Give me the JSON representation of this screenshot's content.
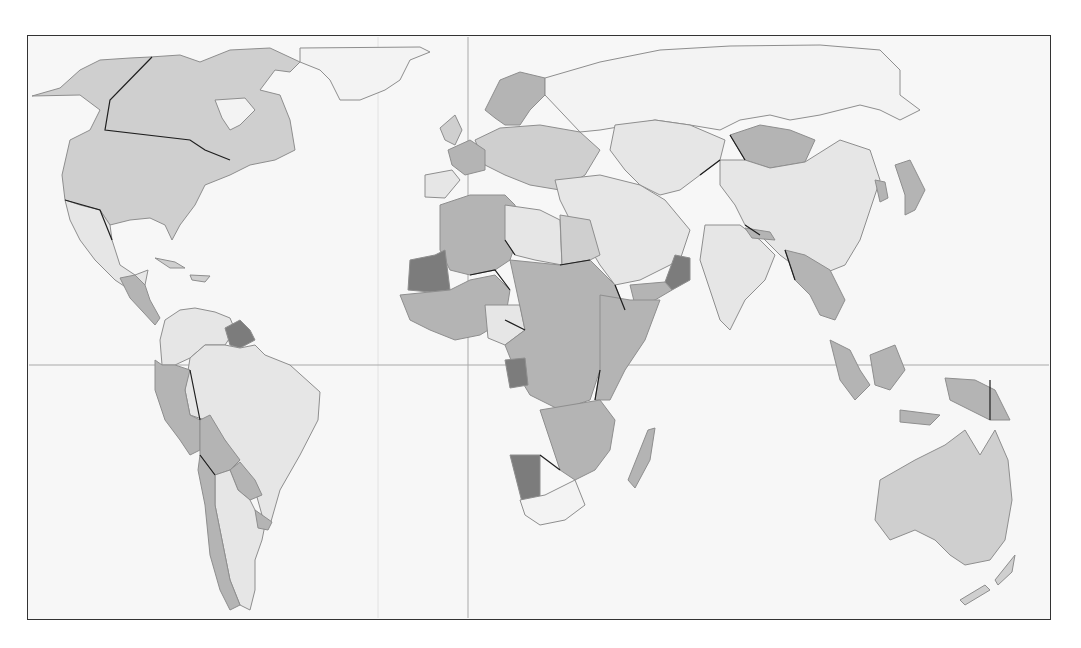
{
  "map": {
    "type": "choropleth world map",
    "projection": "Robinson-like, Pacific-split",
    "frame": {
      "x": 27,
      "y": 35,
      "width": 1024,
      "height": 585
    },
    "background": "#f7f7f7",
    "classes": [
      {
        "name": "no-data",
        "color": "#f3f3f3"
      },
      {
        "name": "low",
        "color": "#e6e6e6"
      },
      {
        "name": "medium",
        "color": "#cfcfcf"
      },
      {
        "name": "high",
        "color": "#b4b4b4"
      },
      {
        "name": "very-high",
        "color": "#7c7c7c"
      }
    ],
    "gridlines": {
      "equator_y": 365,
      "prime_meridian_x": 468
    },
    "regions": [
      {
        "name": "greenland",
        "class": "no-data"
      },
      {
        "name": "alaska-canada-usa",
        "class": "medium"
      },
      {
        "name": "mexico",
        "class": "low"
      },
      {
        "name": "central-america",
        "class": "high"
      },
      {
        "name": "caribbean",
        "class": "medium"
      },
      {
        "name": "colombia-venezuela",
        "class": "low"
      },
      {
        "name": "guyana-suriname",
        "class": "very-high"
      },
      {
        "name": "brazil",
        "class": "low"
      },
      {
        "name": "ecuador-peru",
        "class": "high"
      },
      {
        "name": "bolivia",
        "class": "high"
      },
      {
        "name": "paraguay",
        "class": "high"
      },
      {
        "name": "chile",
        "class": "high"
      },
      {
        "name": "argentina",
        "class": "low"
      },
      {
        "name": "uruguay",
        "class": "high"
      },
      {
        "name": "western-europe",
        "class": "medium"
      },
      {
        "name": "france",
        "class": "high"
      },
      {
        "name": "iberia",
        "class": "low"
      },
      {
        "name": "scandinavia",
        "class": "high"
      },
      {
        "name": "russia",
        "class": "no-data"
      },
      {
        "name": "central-asia",
        "class": "low"
      },
      {
        "name": "mongolia",
        "class": "high"
      },
      {
        "name": "china",
        "class": "low"
      },
      {
        "name": "japan",
        "class": "high"
      },
      {
        "name": "korea",
        "class": "high"
      },
      {
        "name": "middle-east",
        "class": "low"
      },
      {
        "name": "oman",
        "class": "very-high"
      },
      {
        "name": "yemen",
        "class": "high"
      },
      {
        "name": "india",
        "class": "low"
      },
      {
        "name": "nepal",
        "class": "high"
      },
      {
        "name": "southeast-asia",
        "class": "high"
      },
      {
        "name": "indonesia",
        "class": "high"
      },
      {
        "name": "papua-new-guinea",
        "class": "high"
      },
      {
        "name": "australia",
        "class": "medium"
      },
      {
        "name": "new-zealand",
        "class": "medium"
      },
      {
        "name": "north-africa",
        "class": "high"
      },
      {
        "name": "libya",
        "class": "low"
      },
      {
        "name": "mauritania",
        "class": "very-high"
      },
      {
        "name": "west-africa",
        "class": "high"
      },
      {
        "name": "nigeria",
        "class": "low"
      },
      {
        "name": "central-africa",
        "class": "high"
      },
      {
        "name": "gabon",
        "class": "very-high"
      },
      {
        "name": "east-africa",
        "class": "high"
      },
      {
        "name": "southern-africa",
        "class": "high"
      },
      {
        "name": "namibia",
        "class": "very-high"
      },
      {
        "name": "south-africa",
        "class": "no-data"
      },
      {
        "name": "madagascar",
        "class": "high"
      }
    ]
  }
}
